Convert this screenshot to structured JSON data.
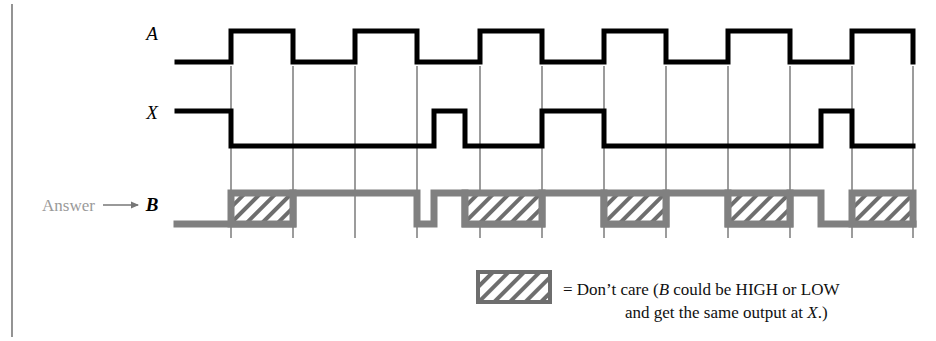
{
  "figure": {
    "type": "digital-timing-diagram",
    "background_color": "#ffffff",
    "border_color": "#555555"
  },
  "signals": {
    "a": {
      "label": "A",
      "color": "#000000",
      "role": "input-waveform"
    },
    "x": {
      "label": "X",
      "color": "#000000",
      "role": "output-waveform"
    },
    "b": {
      "label": "B",
      "color": "#808080",
      "role": "answer-waveform",
      "prefix_text": "Answer",
      "arrow_glyph": "⟶"
    }
  },
  "legend": {
    "swatch_name": "dont-care-hatch",
    "line1": "= Don’t care (",
    "line1_italic": "B",
    "line1_rest": " could be HIGH or LOW",
    "line2": "and get the same output at ",
    "line2_italic": "X",
    "line2_rest": ".)"
  },
  "chart_data": {
    "type": "line",
    "title": "",
    "xlabel": "",
    "ylabel": "",
    "grid": true,
    "legend_position": "bottom-right",
    "x_axis": {
      "pixel_start": 177,
      "pixel_end": 913,
      "gridlines_px": [
        231,
        293,
        355,
        417,
        480,
        542,
        604,
        666,
        728,
        790,
        852,
        913
      ],
      "grid_top_px": 66,
      "grid_bottom_px": 238,
      "tick_spacing_px": 62
    },
    "series": [
      {
        "name": "A",
        "kind": "digital",
        "high_y_px": 31,
        "low_y_px": 62,
        "stroke_px": 5,
        "start_px": 177,
        "end_px": 913,
        "initial_level": 0,
        "transitions_px": [
          231,
          293,
          355,
          417,
          480,
          542,
          604,
          666,
          728,
          790,
          852,
          913
        ],
        "levels": [
          0,
          1,
          0,
          1,
          0,
          1,
          0,
          1,
          0,
          1,
          0,
          1,
          0
        ]
      },
      {
        "name": "X",
        "kind": "digital",
        "high_y_px": 111,
        "low_y_px": 146,
        "stroke_px": 5,
        "start_px": 177,
        "end_px": 913,
        "initial_level": 1,
        "transitions_px": [
          231,
          434,
          465,
          542,
          604,
          821,
          852
        ],
        "levels": [
          1,
          0,
          1,
          0,
          1,
          0,
          1,
          0
        ]
      },
      {
        "name": "B",
        "kind": "digital-with-dontcare",
        "high_y_px": 193,
        "low_y_px": 224,
        "stroke_px": 7,
        "start_px": 177,
        "end_px": 913,
        "initial_level": 0,
        "segments": [
          {
            "from_px": 177,
            "to_px": 231,
            "level": 0,
            "dont_care": false
          },
          {
            "from_px": 231,
            "to_px": 293,
            "level": 0,
            "dont_care": true
          },
          {
            "from_px": 293,
            "to_px": 355,
            "level": 1,
            "dont_care": false
          },
          {
            "from_px": 355,
            "to_px": 417,
            "level": 1,
            "dont_care": false
          },
          {
            "from_px": 417,
            "to_px": 434,
            "level": 0,
            "dont_care": false
          },
          {
            "from_px": 434,
            "to_px": 465,
            "level": 1,
            "dont_care": false
          },
          {
            "from_px": 465,
            "to_px": 542,
            "level": 0,
            "dont_care": true
          },
          {
            "from_px": 542,
            "to_px": 604,
            "level": 1,
            "dont_care": false
          },
          {
            "from_px": 604,
            "to_px": 666,
            "level": 0,
            "dont_care": true
          },
          {
            "from_px": 666,
            "to_px": 728,
            "level": 1,
            "dont_care": false
          },
          {
            "from_px": 728,
            "to_px": 790,
            "level": 0,
            "dont_care": true
          },
          {
            "from_px": 790,
            "to_px": 821,
            "level": 1,
            "dont_care": false
          },
          {
            "from_px": 821,
            "to_px": 852,
            "level": 0,
            "dont_care": false
          },
          {
            "from_px": 852,
            "to_px": 913,
            "level": 0,
            "dont_care": true
          }
        ],
        "dont_care_boxes_px": [
          {
            "x": 231,
            "w": 62
          },
          {
            "x": 465,
            "w": 77
          },
          {
            "x": 604,
            "w": 62
          },
          {
            "x": 728,
            "w": 62
          },
          {
            "x": 852,
            "w": 61
          }
        ]
      }
    ]
  }
}
